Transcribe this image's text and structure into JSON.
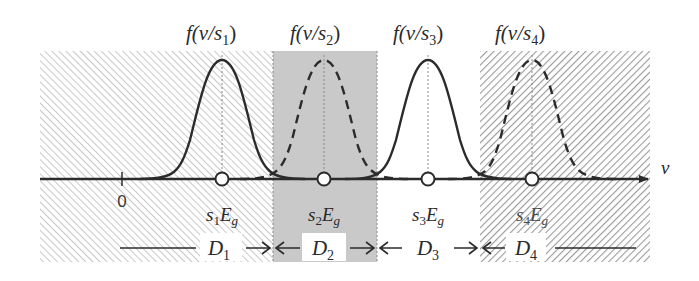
{
  "figure": {
    "axis_label": "v",
    "origin_label": "0",
    "curves": [
      {
        "id": "s1",
        "label_fn": "f(v/s",
        "sub": "1",
        "label_close": ")",
        "point_label": "s",
        "point_sub": "1",
        "point_E": "E",
        "point_g": "g",
        "style": "solid"
      },
      {
        "id": "s2",
        "label_fn": "f(v/s",
        "sub": "2",
        "label_close": ")",
        "point_label": "s",
        "point_sub": "2",
        "point_E": "E",
        "point_g": "g",
        "style": "dashed"
      },
      {
        "id": "s3",
        "label_fn": "f(v/s",
        "sub": "3",
        "label_close": ")",
        "point_label": "s",
        "point_sub": "3",
        "point_E": "E",
        "point_g": "g",
        "style": "solid"
      },
      {
        "id": "s4",
        "label_fn": "f(v/s",
        "sub": "4",
        "label_close": ")",
        "point_label": "s",
        "point_sub": "4",
        "point_E": "E",
        "point_g": "g",
        "style": "dashed"
      }
    ],
    "regions": [
      {
        "id": "D1",
        "label": "D",
        "sub": "1",
        "fill": "hatch-light"
      },
      {
        "id": "D2",
        "label": "D",
        "sub": "2",
        "fill": "gray-stipple"
      },
      {
        "id": "D3",
        "label": "D",
        "sub": "3",
        "fill": "white"
      },
      {
        "id": "D4",
        "label": "D",
        "sub": "4",
        "fill": "hatch-dark"
      }
    ],
    "colors": {
      "line": "#2b2b2b",
      "stipple": "#c9c9c9",
      "hatch_light": "#d0d0d0",
      "hatch_dark": "#9a9a9a",
      "guide": "#8a8a8a"
    }
  }
}
